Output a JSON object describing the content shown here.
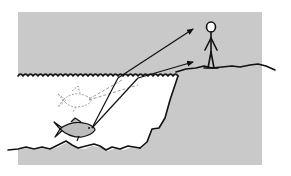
{
  "figure": {
    "description": "Refraction diagram: observer on cliff sees a fish at an apparent (shallower) position",
    "colors": {
      "background": "#ffffff",
      "sky_panel": "#c9c9c9",
      "ground": "#c9c9c9",
      "water": "#ffffff",
      "ink": "#111111",
      "fish_fill": "#bdbdbd",
      "virtual_ink": "#9a9a9a"
    },
    "elements": {
      "observer": "stick-figure-observer",
      "real_fish": "real-fish",
      "apparent_fish": "apparent-fish-dashed",
      "rays": [
        "refracted-ray-upper",
        "refracted-ray-lower"
      ],
      "virtual_rays": [
        "virtual-ray-upper",
        "virtual-ray-lower"
      ],
      "water_surface": "wavy-water-surface",
      "seabed": "wavy-seabed",
      "cliff": "cliff-edge"
    }
  }
}
